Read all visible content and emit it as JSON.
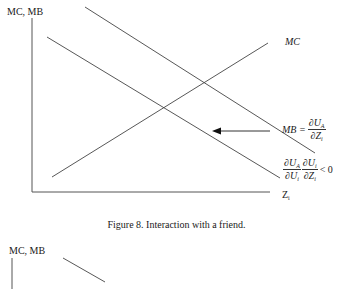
{
  "figure8": {
    "y_axis_label": "MC, MB",
    "x_axis_label": "Z",
    "x_axis_label_sub": "i",
    "mc_label": "MC",
    "mb_label_lhs": "MB =",
    "mb_num": "∂U",
    "mb_num_sub": "A",
    "mb_den": "∂Z",
    "mb_den_sub": "i",
    "shift_num1": "∂U",
    "shift_num1_sub": "A",
    "shift_den1": "∂U",
    "shift_den1_sub": "i",
    "shift_num2": "∂U",
    "shift_num2_sub": "i",
    "shift_den2": "∂Z",
    "shift_den2_sub": "i",
    "shift_rhs": "< 0",
    "caption": "Figure 8.  Interaction with a friend.",
    "lines": [
      {
        "name": "MB-original",
        "x1": 85,
        "y1": 7,
        "x2": 315,
        "y2": 153
      },
      {
        "name": "MB-shifted",
        "x1": 47,
        "y1": 37,
        "x2": 280,
        "y2": 178
      },
      {
        "name": "MC",
        "x1": 52,
        "y1": 177,
        "x2": 268,
        "y2": 43
      }
    ],
    "arrow": {
      "from_x": 270,
      "to_x": 213,
      "y": 131,
      "direction": "left"
    }
  },
  "figure9_partial": {
    "y_axis_label": "MC, MB"
  }
}
